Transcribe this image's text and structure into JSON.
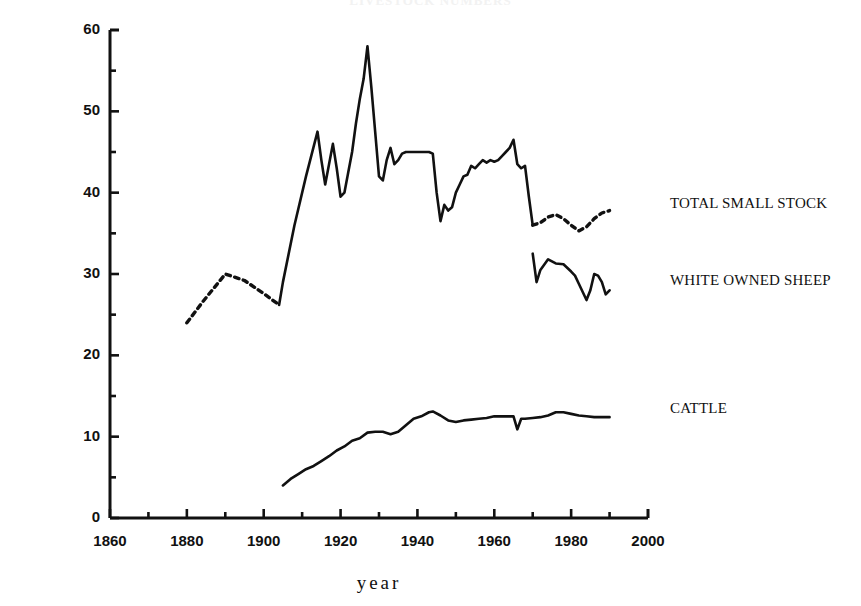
{
  "chart_data": {
    "type": "line",
    "title": "LIVESTOCK NUMBERS",
    "xlabel": "year",
    "ylabel": "million head of livestock",
    "xlim": [
      1860,
      2000
    ],
    "ylim": [
      0,
      60
    ],
    "xticks": [
      1860,
      1880,
      1900,
      1920,
      1940,
      1960,
      1980,
      2000
    ],
    "xtick_labels": [
      "1860",
      "1880",
      "1900",
      "1920",
      "1940",
      "1960",
      "1980",
      "2000"
    ],
    "x_minor_step": 10,
    "yticks": [
      0,
      10,
      20,
      30,
      40,
      50,
      60
    ],
    "ytick_labels": [
      "0",
      "10",
      "20",
      "30",
      "40",
      "50",
      "60"
    ],
    "y_minor_step": 5,
    "grid": false,
    "legend_position": "right-inline",
    "series": [
      {
        "name": "TOTAL SMALL STOCK",
        "label_x": 1986,
        "label_y": 38.5,
        "style": "mixed-dotted-solid",
        "segments": [
          {
            "style": "dotted",
            "x": [
              1880,
              1884,
              1890,
              1895,
              1900,
              1904
            ],
            "y": [
              24.0,
              26.5,
              30.0,
              29.2,
              27.6,
              26.2
            ]
          },
          {
            "style": "solid",
            "x": [
              1904,
              1905,
              1908,
              1911,
              1914,
              1915,
              1916,
              1917,
              1918,
              1919,
              1920,
              1921,
              1922,
              1923,
              1924,
              1925,
              1926,
              1927,
              1928,
              1929,
              1930,
              1931,
              1932,
              1933,
              1934,
              1935,
              1936,
              1937,
              1938,
              1939,
              1940,
              1941,
              1942,
              1943,
              1944,
              1945,
              1946,
              1947,
              1948,
              1949,
              1950,
              1951,
              1952,
              1953,
              1954,
              1955,
              1956,
              1957,
              1958,
              1959,
              1960,
              1961,
              1962,
              1963,
              1964,
              1965,
              1966,
              1967,
              1968,
              1969,
              1970
            ],
            "y": [
              26.2,
              29.0,
              36.0,
              42.0,
              47.5,
              44.0,
              41.0,
              43.5,
              46.0,
              43.0,
              39.5,
              40.0,
              42.5,
              45.0,
              48.5,
              51.5,
              54.0,
              58.0,
              53.0,
              47.5,
              42.0,
              41.5,
              44.0,
              45.5,
              43.5,
              44.0,
              44.8,
              45.0,
              45.0,
              45.0,
              45.0,
              45.0,
              45.0,
              45.0,
              44.8,
              40.0,
              36.5,
              38.5,
              37.8,
              38.2,
              40.0,
              41.0,
              42.0,
              42.2,
              43.3,
              43.0,
              43.5,
              44.0,
              43.7,
              44.0,
              43.8,
              44.0,
              44.5,
              45.0,
              45.5,
              46.5,
              43.5,
              43.0,
              43.3,
              39.5,
              36.0
            ]
          },
          {
            "style": "dotted",
            "x": [
              1970,
              1972,
              1974,
              1976,
              1978,
              1980,
              1982,
              1984,
              1986,
              1988,
              1990
            ],
            "y": [
              36.0,
              36.3,
              37.0,
              37.3,
              36.8,
              36.0,
              35.3,
              35.8,
              36.8,
              37.5,
              37.8
            ]
          }
        ]
      },
      {
        "name": "WHITE OWNED SHEEP",
        "label_x": 1986,
        "label_y": 29.0,
        "style": "solid",
        "segments": [
          {
            "style": "solid",
            "x": [
              1970,
              1971,
              1972,
              1974,
              1976,
              1978,
              1980,
              1981,
              1982,
              1984,
              1985,
              1986,
              1987,
              1988,
              1989,
              1990
            ],
            "y": [
              32.5,
              29.0,
              30.5,
              31.8,
              31.3,
              31.2,
              30.3,
              29.8,
              28.8,
              26.8,
              28.0,
              30.0,
              29.8,
              29.0,
              27.5,
              28.0
            ]
          }
        ]
      },
      {
        "name": "CATTLE",
        "label_x": 1986,
        "label_y": 13.3,
        "style": "solid",
        "segments": [
          {
            "style": "solid",
            "x": [
              1905,
              1907,
              1909,
              1911,
              1913,
              1915,
              1917,
              1919,
              1921,
              1923,
              1925,
              1927,
              1929,
              1931,
              1933,
              1935,
              1937,
              1939,
              1941,
              1943,
              1944,
              1946,
              1948,
              1950,
              1952,
              1954,
              1956,
              1958,
              1960,
              1962,
              1964,
              1965,
              1966,
              1967,
              1968,
              1970,
              1972,
              1974,
              1976,
              1978,
              1980,
              1982,
              1984,
              1986,
              1988,
              1990
            ],
            "y": [
              4.0,
              4.8,
              5.4,
              6.0,
              6.4,
              7.0,
              7.6,
              8.3,
              8.8,
              9.5,
              9.8,
              10.5,
              10.6,
              10.6,
              10.3,
              10.6,
              11.4,
              12.2,
              12.5,
              13.0,
              13.1,
              12.6,
              12.0,
              11.8,
              12.0,
              12.1,
              12.2,
              12.3,
              12.5,
              12.5,
              12.5,
              12.5,
              10.9,
              12.2,
              12.2,
              12.3,
              12.4,
              12.6,
              13.0,
              13.0,
              12.8,
              12.6,
              12.5,
              12.4,
              12.4,
              12.4
            ]
          }
        ]
      }
    ]
  },
  "axes": {
    "y_tick_labels": [
      "60",
      "50",
      "40",
      "30",
      "20",
      "10",
      "0"
    ],
    "x_tick_labels": [
      "1860",
      "1880",
      "1900",
      "1920",
      "1940",
      "1960",
      "1980",
      "2000"
    ],
    "ylabel": "million head of livestock",
    "xlabel": "year"
  },
  "labels": {
    "total_small_stock": "TOTAL SMALL STOCK",
    "white_owned_sheep": "WHITE OWNED SHEEP",
    "cattle": "CATTLE"
  },
  "colors": {
    "line": "#111111",
    "axis": "#111111",
    "background": "#ffffff"
  }
}
